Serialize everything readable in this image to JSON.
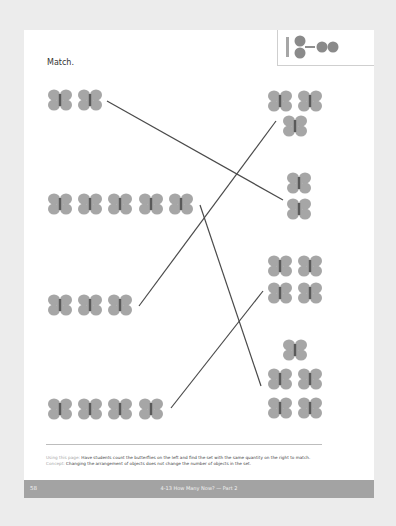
{
  "worksheet": {
    "instruction": "Match.",
    "badge_icon": "number-bond-icon",
    "colors": {
      "background": "#ececec",
      "page": "#ffffff",
      "butterfly_wing": "#a6a6a6",
      "butterfly_body": "#5a5a5a",
      "line": "#4a4a4a",
      "footer_bar": "#a3a3a3"
    },
    "left_sets": [
      {
        "count": 2
      },
      {
        "count": 5
      },
      {
        "count": 3
      },
      {
        "count": 4
      }
    ],
    "right_sets": [
      {
        "count": 3,
        "arrangement": "2 over 1"
      },
      {
        "count": 2,
        "arrangement": "vertical column"
      },
      {
        "count": 4,
        "arrangement": "2x2 grid"
      },
      {
        "count": 5,
        "arrangement": "1 over 2 over 2"
      }
    ],
    "matches": [
      {
        "left": 2,
        "right": 2
      },
      {
        "left": 5,
        "right": 5
      },
      {
        "left": 3,
        "right": 3
      },
      {
        "left": 4,
        "right": 4
      }
    ]
  },
  "notes": {
    "using_label": "Using this page:",
    "using_text": "Have students count the butterflies on the left and find the set with the same quantity on the right to match.",
    "concept_label": "Concept:",
    "concept_text": "Changing the arrangement of objects does not change the number of objects in the set."
  },
  "footer": {
    "page_number": "58",
    "title": "4-13 How Many Now? — Part 2"
  }
}
